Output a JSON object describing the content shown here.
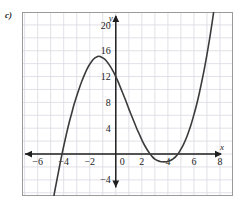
{
  "panel": {
    "label": "c)"
  },
  "chart_data": {
    "type": "line",
    "title": "",
    "subtitle": "",
    "xlabel": "x",
    "ylabel": "y",
    "xlim": [
      -7.2,
      9.0
    ],
    "ylim": [
      -6.5,
      22.0
    ],
    "grid": true,
    "grid_step_x": 1,
    "grid_step_y": 2,
    "legend": "none",
    "x_ticks": [
      -6,
      -4,
      -2,
      0,
      2,
      4,
      6,
      8
    ],
    "x_tick_labels": [
      "−6",
      "−4",
      "−2",
      "0",
      "2",
      "4",
      "6",
      "8"
    ],
    "y_ticks": [
      -4,
      4,
      8,
      12,
      16,
      20
    ],
    "y_tick_labels": [
      "−4",
      "4",
      "8",
      "12",
      "16",
      "20"
    ],
    "curve_label": "cubic polynomial",
    "series": [
      {
        "name": "cubic",
        "equation_approx": "y = 0.2(x + 4.2)(x - 3.3)(x - 4.9)",
        "points": [
          [
            -5.3,
            -13.1
          ],
          [
            -5.1,
            -10.6
          ],
          [
            -4.9,
            -8.2
          ],
          [
            -4.7,
            -5.9
          ],
          [
            -4.5,
            -3.8
          ],
          [
            -4.3,
            -1.7
          ],
          [
            -4.2,
            -0.7
          ],
          [
            -4.0,
            1.2
          ],
          [
            -3.8,
            3.0
          ],
          [
            -3.6,
            4.7
          ],
          [
            -3.4,
            6.2
          ],
          [
            -3.2,
            7.7
          ],
          [
            -3.0,
            9.0
          ],
          [
            -2.8,
            10.2
          ],
          [
            -2.6,
            11.3
          ],
          [
            -2.4,
            12.3
          ],
          [
            -2.2,
            13.2
          ],
          [
            -2.0,
            13.9
          ],
          [
            -1.8,
            14.5
          ],
          [
            -1.6,
            14.9
          ],
          [
            -1.4,
            15.1
          ],
          [
            -1.3,
            15.15
          ],
          [
            -1.2,
            15.1
          ],
          [
            -1.0,
            14.9
          ],
          [
            -0.8,
            14.6
          ],
          [
            -0.6,
            14.1
          ],
          [
            -0.4,
            13.5
          ],
          [
            -0.2,
            12.8
          ],
          [
            0.0,
            12.0
          ],
          [
            0.2,
            11.1
          ],
          [
            0.4,
            10.1
          ],
          [
            0.6,
            9.1
          ],
          [
            0.8,
            8.1
          ],
          [
            1.0,
            7.0
          ],
          [
            1.2,
            6.0
          ],
          [
            1.4,
            5.0
          ],
          [
            1.6,
            4.0
          ],
          [
            1.8,
            3.1
          ],
          [
            2.0,
            2.2
          ],
          [
            2.2,
            1.4
          ],
          [
            2.4,
            0.7
          ],
          [
            2.6,
            0.1
          ],
          [
            2.8,
            -0.4
          ],
          [
            3.0,
            -0.8
          ],
          [
            3.2,
            -1.0
          ],
          [
            3.4,
            -1.15
          ],
          [
            3.6,
            -1.2
          ],
          [
            3.8,
            -1.2
          ],
          [
            4.0,
            -1.15
          ],
          [
            4.2,
            -1.0
          ],
          [
            4.4,
            -0.75
          ],
          [
            4.6,
            -0.4
          ],
          [
            4.8,
            0.1
          ],
          [
            4.9,
            0.4
          ],
          [
            5.0,
            0.75
          ],
          [
            5.2,
            1.5
          ],
          [
            5.4,
            2.4
          ],
          [
            5.6,
            3.5
          ],
          [
            5.8,
            4.7
          ],
          [
            6.0,
            6.1
          ],
          [
            6.2,
            7.6
          ],
          [
            6.4,
            9.3
          ],
          [
            6.6,
            11.2
          ],
          [
            6.8,
            13.2
          ],
          [
            7.0,
            15.4
          ],
          [
            7.2,
            17.8
          ],
          [
            7.4,
            20.4
          ],
          [
            7.55,
            22.5
          ]
        ]
      }
    ],
    "features": {
      "y_intercept": 12,
      "local_max": [
        -1.3,
        15.1
      ],
      "local_min": [
        3.7,
        -1.2
      ],
      "roots": [
        -4.2,
        3.3,
        4.9
      ]
    },
    "colors": {
      "curve": "#3b3b3b",
      "axis": "#1f1f1f",
      "grid": "#d9d9e2",
      "frame": "#9a9a9a",
      "background": "#ffffff"
    }
  }
}
